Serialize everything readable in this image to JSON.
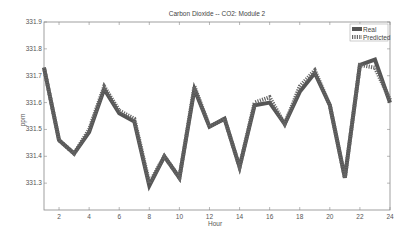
{
  "chart_data": {
    "type": "line",
    "title": "Carbon Dioxide -- CO2: Module 2",
    "xlabel": "Hour",
    "ylabel": "ppm",
    "x": [
      1,
      2,
      3,
      4,
      5,
      6,
      7,
      8,
      9,
      10,
      11,
      12,
      13,
      14,
      15,
      16,
      17,
      18,
      19,
      20,
      21,
      22,
      23,
      24
    ],
    "xlim": [
      1,
      24
    ],
    "ylim": [
      331.2,
      331.9
    ],
    "xticks": [
      2,
      4,
      6,
      8,
      10,
      12,
      14,
      16,
      18,
      20,
      22,
      24
    ],
    "yticks": [
      331.3,
      331.4,
      331.5,
      331.6,
      331.7,
      331.8,
      331.9
    ],
    "grid": false,
    "legend_position": "top-right",
    "series": [
      {
        "name": "Real",
        "style": "solid",
        "values": [
          331.73,
          331.46,
          331.41,
          331.49,
          331.65,
          331.56,
          331.53,
          331.29,
          331.4,
          331.32,
          331.65,
          331.51,
          331.54,
          331.36,
          331.59,
          331.6,
          331.52,
          331.64,
          331.71,
          331.59,
          331.32,
          331.74,
          331.76,
          331.6
        ]
      },
      {
        "name": "Predicted",
        "style": "dotted",
        "values": [
          331.73,
          331.46,
          331.41,
          331.5,
          331.66,
          331.57,
          331.54,
          331.3,
          331.4,
          331.32,
          331.66,
          331.51,
          331.54,
          331.36,
          331.6,
          331.62,
          331.52,
          331.66,
          331.72,
          331.59,
          331.32,
          331.74,
          331.73,
          331.61
        ]
      }
    ]
  },
  "colors": {
    "real": "#555555",
    "predicted": "#666666",
    "axis": "#888888"
  },
  "legend": {
    "real_label": "Real",
    "predicted_label": "Predicted"
  }
}
